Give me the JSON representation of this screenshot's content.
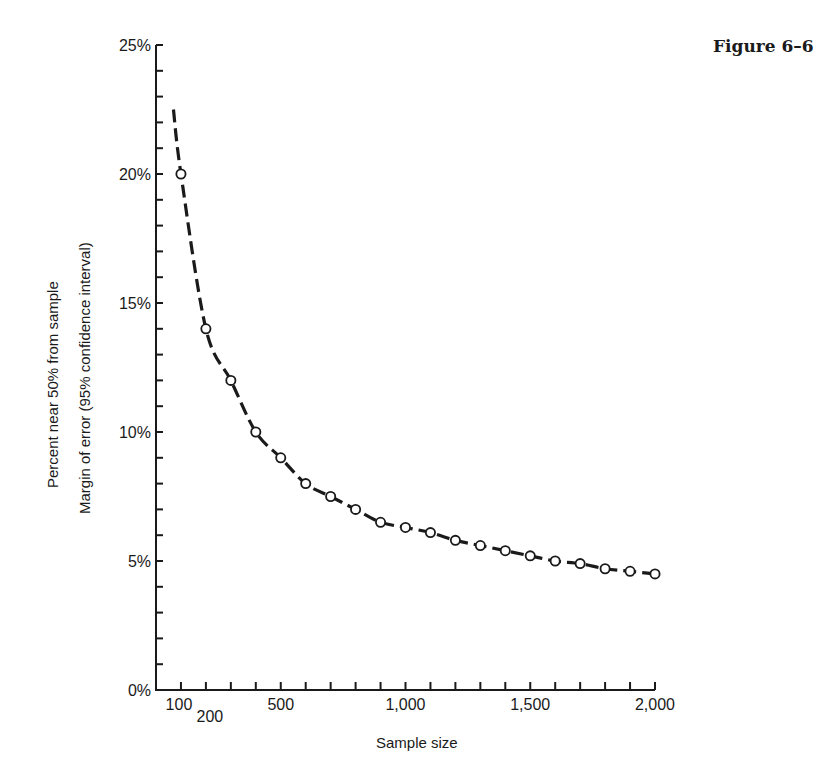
{
  "figure_label": "Figure 6–6",
  "chart_data": {
    "type": "line",
    "title": "Figure 6–6",
    "xlabel": "Sample size",
    "ylabel": [
      "Percent near 50% from sample",
      "Margin of error (95% confidence interval)"
    ],
    "xlim": [
      0,
      2000
    ],
    "ylim": [
      0,
      25
    ],
    "x_tick_labels": [
      {
        "value": 100,
        "label": "100"
      },
      {
        "value": 200,
        "label": "200"
      },
      {
        "value": 500,
        "label": "500"
      },
      {
        "value": 1000,
        "label": "1,000"
      },
      {
        "value": 1500,
        "label": "1,500"
      },
      {
        "value": 2000,
        "label": "2,000"
      }
    ],
    "x_minor_ticks_every": 100,
    "y_tick_labels": [
      {
        "value": 0,
        "label": "0%"
      },
      {
        "value": 5,
        "label": "5%"
      },
      {
        "value": 10,
        "label": "10%"
      },
      {
        "value": 15,
        "label": "15%"
      },
      {
        "value": 20,
        "label": "20%"
      },
      {
        "value": 25,
        "label": "25%"
      }
    ],
    "y_minor_ticks_every": 1,
    "grid": false,
    "legend": null,
    "series": [
      {
        "name": "Margin of error",
        "style": "dashed line with open circle markers",
        "curve_start": {
          "x": 70,
          "y": 22.5
        },
        "x": [
          100,
          200,
          300,
          400,
          500,
          600,
          700,
          800,
          900,
          1000,
          1100,
          1200,
          1300,
          1400,
          1500,
          1600,
          1700,
          1800,
          1900,
          2000
        ],
        "values": [
          20,
          14,
          12,
          10,
          9,
          8,
          7.5,
          7,
          6.5,
          6.3,
          6.1,
          5.8,
          5.6,
          5.4,
          5.2,
          5,
          4.9,
          4.7,
          4.6,
          4.5
        ]
      }
    ]
  },
  "layout": {
    "x0_px": 156,
    "px_per_unit_x": 0.2495,
    "y0_px": 690,
    "px_per_unit_y": 25.8
  }
}
